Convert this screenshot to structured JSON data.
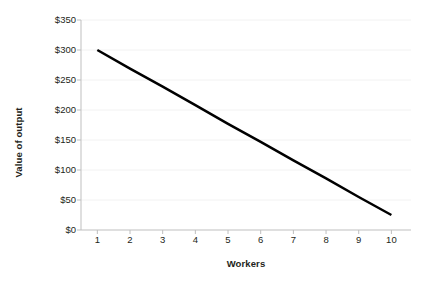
{
  "chart_data": {
    "type": "line",
    "title": "",
    "subtitle": "",
    "xlabel": "Workers",
    "ylabel": "Value of output",
    "x": [
      1,
      2,
      3,
      4,
      5,
      6,
      7,
      8,
      9,
      10
    ],
    "values": [
      300,
      269,
      239,
      208,
      177,
      147,
      116,
      86,
      55,
      25
    ],
    "series": [
      {
        "name": "Value of output",
        "values": [
          300,
          269,
          239,
          208,
          177,
          147,
          116,
          86,
          55,
          25
        ],
        "color": "#000000"
      }
    ],
    "xlim": [
      0.5,
      10.6
    ],
    "ylim": [
      0,
      350
    ],
    "xtick_labels": [
      "1",
      "2",
      "3",
      "4",
      "5",
      "6",
      "7",
      "8",
      "9",
      "10"
    ],
    "ytick_values": [
      0,
      50,
      100,
      150,
      200,
      250,
      300,
      350
    ],
    "ytick_labels": [
      "$0",
      "$50",
      "$100",
      "$150",
      "$200",
      "$250",
      "$300",
      "$350"
    ],
    "grid": true,
    "grid_color": "#f2f2f2",
    "axis_color": "#bfbfbf",
    "line_color": "#000000",
    "line_width": 2.5,
    "legend": false,
    "legend_position": "none",
    "background": "#ffffff",
    "annotations": []
  }
}
